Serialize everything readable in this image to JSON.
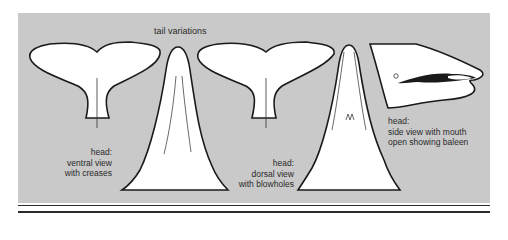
{
  "figure": {
    "title": "tail variations",
    "labels": {
      "ventral": [
        "head:",
        "ventral view",
        "with creases"
      ],
      "dorsal": [
        "head:",
        "dorsal view",
        "with blowholes"
      ],
      "side": [
        "head:",
        "side view with mouth",
        "open showing baleen"
      ]
    },
    "colors": {
      "panel": "#c9c9c9",
      "shape_fill": "#ffffff",
      "outline": "#1a1a1a",
      "text": "#2a2a2a"
    }
  }
}
